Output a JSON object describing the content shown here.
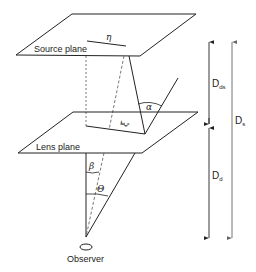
{
  "diagram": {
    "type": "gravitational-lensing-geometry",
    "planes": {
      "source": {
        "label": "Source plane"
      },
      "lens": {
        "label": "Lens plane"
      }
    },
    "observer": {
      "label": "Observer"
    },
    "symbols": {
      "eta": "η",
      "xi": "ξ",
      "alpha": "α",
      "beta": "β",
      "theta": "Θ"
    },
    "distances": [
      {
        "id": "D_ds",
        "main": "D",
        "sub": "ds",
        "from": "lens-plane",
        "to": "source-plane"
      },
      {
        "id": "D_d",
        "main": "D",
        "sub": "d",
        "from": "observer",
        "to": "lens-plane"
      },
      {
        "id": "D_s",
        "main": "D",
        "sub": "s",
        "from": "observer",
        "to": "source-plane"
      }
    ],
    "colors": {
      "line": "#222222",
      "dashed": "#555555",
      "arrow_outer": "#777777",
      "background": "#ffffff"
    }
  }
}
